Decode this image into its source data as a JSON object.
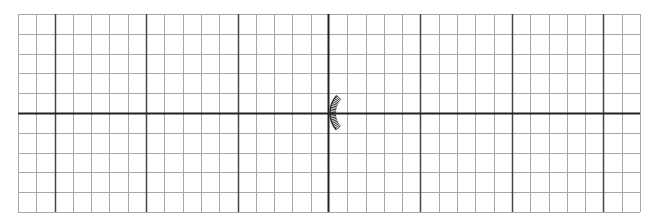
{
  "grid": {
    "left": 18,
    "top": 14,
    "right": 640,
    "bottom": 212,
    "cols": 34,
    "rows": 10,
    "major_every": 5,
    "major_x_offset": 2,
    "axis_x": 328,
    "axis_y": 113,
    "minor_color": "#a8a8a8",
    "major_color": "#444444",
    "axis_color": "#222222"
  },
  "marker": {
    "type": "hatched-arc",
    "cx": 356,
    "cy": 113,
    "r": 26,
    "start_deg": 140,
    "end_deg": 222,
    "color": "#333333"
  }
}
